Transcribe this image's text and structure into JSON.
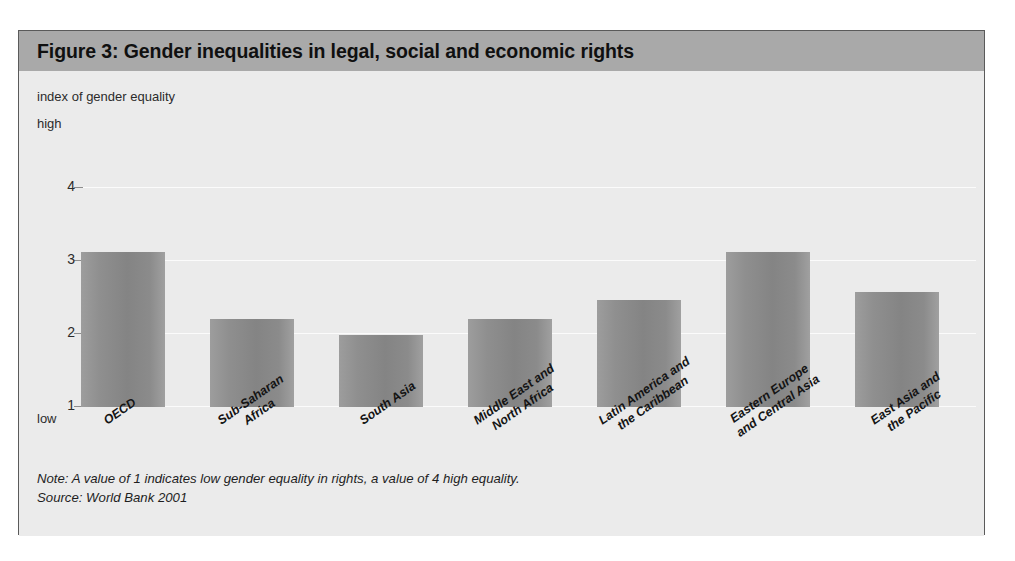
{
  "figure": {
    "title": "Figure 3: Gender inequalities in legal, social and economic rights",
    "note": "Note: A value of 1 indicates low gender equality in rights, a value of 4 high equality.",
    "source": "Source: World Bank 2001",
    "axis_title": "index of gender equality",
    "high_label": "high",
    "low_label": "low",
    "colors": {
      "title_band": "#a9a9a9",
      "panel_background": "#ebebeb",
      "bar_fill": "#8f8f8f",
      "gridline": "#fbfbfb",
      "border": "#5a5a5a"
    }
  },
  "chart_data": {
    "type": "bar",
    "title": "Figure 3: Gender inequalities in legal, social and economic rights",
    "xlabel": "",
    "ylabel": "index of gender equality",
    "ylim": [
      1,
      4
    ],
    "yticks": [
      "1",
      "2",
      "3",
      "4"
    ],
    "ytick_values": [
      1,
      2,
      3,
      4
    ],
    "grid": true,
    "legend": "none",
    "categories": [
      "OECD",
      "Sub-Saharan Africa",
      "South Asia",
      "Middle East and North Africa",
      "Latin America and the Caribbean",
      "Eastern Europe and Central Asia",
      "East Asia and the Pacific"
    ],
    "category_lines": [
      [
        "OECD"
      ],
      [
        "Sub-Saharan",
        "Africa"
      ],
      [
        "South Asia"
      ],
      [
        "Middle East and",
        "North Africa"
      ],
      [
        "Latin America and",
        "the Caribbean"
      ],
      [
        "Eastern Europe",
        "and Central Asia"
      ],
      [
        "East Asia and",
        "the Pacific"
      ]
    ],
    "values": [
      3.12,
      2.2,
      1.98,
      2.2,
      2.47,
      3.12,
      2.57
    ],
    "annotations": {
      "axis_high": "high",
      "axis_low": "low",
      "note": "Note: A value of 1 indicates low gender equality in rights, a value of 4 high equality.",
      "source": "Source: World Bank 2001"
    }
  }
}
